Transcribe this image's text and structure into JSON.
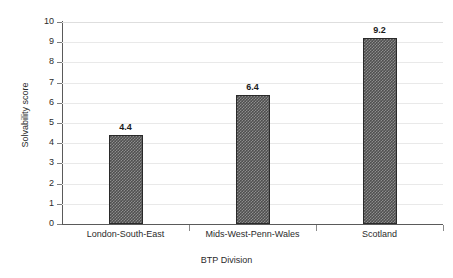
{
  "running_head": "Act Nilsson et al.",
  "chart_data": {
    "type": "bar",
    "title": "",
    "xlabel": "BTP Division",
    "ylabel": "Solvability score",
    "categories": [
      "London-South-East",
      "Mids-West-Penn-Wales",
      "Scotland"
    ],
    "values": [
      4.4,
      6.4,
      9.2
    ],
    "value_labels": [
      "4.4",
      "6.4",
      "9.2"
    ],
    "ylim": [
      0,
      10
    ],
    "ytick_labels": [
      "10",
      "9",
      "8",
      "7",
      "6",
      "5",
      "4",
      "3",
      "2",
      "1",
      "0"
    ],
    "ytick_values": [
      10,
      9,
      8,
      7,
      6,
      5,
      4,
      3,
      2,
      1,
      0
    ],
    "grid": true,
    "legend": "none",
    "bar_fill": "#4f4f4f",
    "bar_pattern": "checkerboard",
    "bar_edge_color": "#2a2a2a",
    "axis_color": "#5a5a5a",
    "gridline_color": "#e9e9e9",
    "background": "#ffffff"
  }
}
